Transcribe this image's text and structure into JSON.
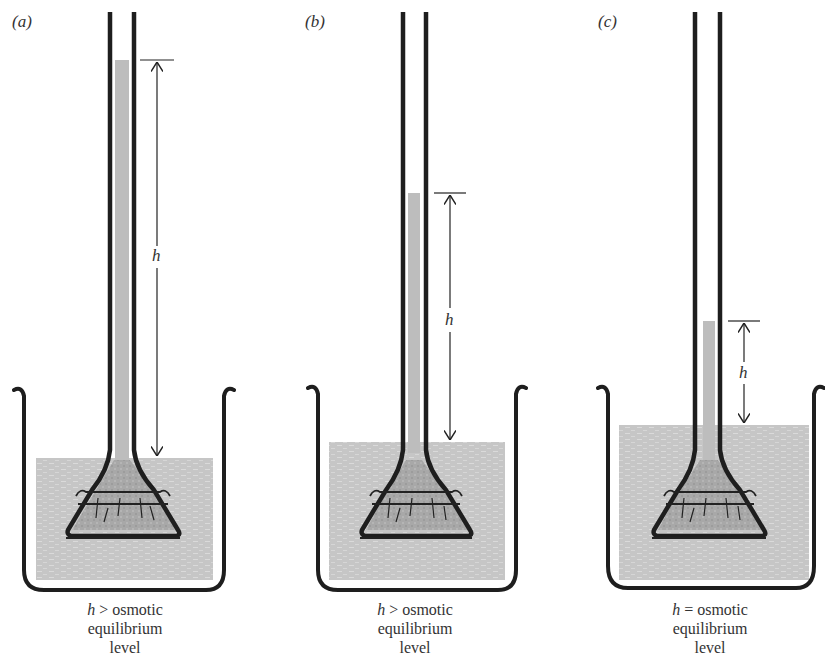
{
  "figure": {
    "panels": [
      {
        "id": "a",
        "label": "(a)",
        "h_label": "h",
        "caption": {
          "h": "h",
          "relation": ">",
          "line1_rest": "osmotic",
          "line2": "equilibrium",
          "line3": "level"
        },
        "column_top_y": 60,
        "beaker_water_y": 458
      },
      {
        "id": "b",
        "label": "(b)",
        "h_label": "h",
        "caption": {
          "h": "h",
          "relation": ">",
          "line1_rest": "osmotic",
          "line2": "equilibrium",
          "line3": "level"
        },
        "column_top_y": 193,
        "beaker_water_y": 442
      },
      {
        "id": "c",
        "label": "(c)",
        "h_label": "h",
        "caption": {
          "h": "h",
          "relation": "=",
          "line1_rest": "osmotic",
          "line2": "equilibrium",
          "line3": "level"
        },
        "column_top_y": 321,
        "beaker_water_y": 425
      }
    ],
    "colors": {
      "glass": "#1e1e1e",
      "water": "#c4c4c4",
      "solution": "#a9a9a9",
      "background": "#ffffff"
    }
  }
}
